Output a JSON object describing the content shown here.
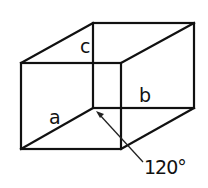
{
  "diagram": {
    "type": "isometric-box",
    "labels": {
      "a": "a",
      "b": "b",
      "c": "c",
      "angle": "120°"
    },
    "colors": {
      "stroke": "#111111",
      "background": "#ffffff"
    }
  }
}
